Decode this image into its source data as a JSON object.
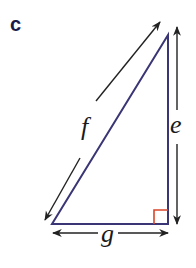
{
  "figure": {
    "part_label": "c",
    "shape": "right triangle",
    "sides": {
      "hypotenuse": "f",
      "vertical": "e",
      "base": "g"
    },
    "right_angle_corner": "bottom-right",
    "colors": {
      "triangle_stroke": "#3a3575",
      "arrow_stroke": "#222222",
      "right_angle_marker": "#d9452a",
      "part_label": "#1c1a4a"
    }
  }
}
